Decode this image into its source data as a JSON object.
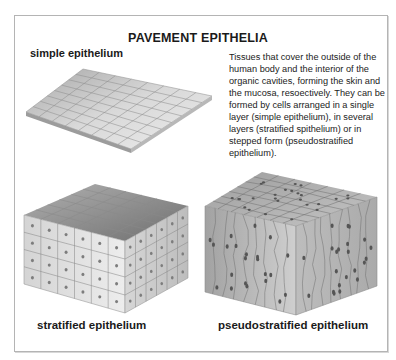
{
  "title": "PAVEMENT EPITHELIA",
  "figures": {
    "simple": {
      "label": "simple epithelium",
      "rows": 8,
      "cols": 8
    },
    "stratified": {
      "label": "stratified epithelium",
      "layers": 4,
      "grid": 6
    },
    "pseudostratified": {
      "label": "pseudostratified epithelium"
    }
  },
  "description": {
    "lines": [
      "Tissues that cover the outside of the",
      "human body and the interior of the",
      "organic cavities, forming the skin and",
      "the mucosa, resoectively. They can be",
      "formed by cells arranged in a single",
      "layer (simple epithelium), in several",
      "layers (stratified spithelium) or in",
      "stepped form (pseudostratified",
      "epithelium)."
    ]
  },
  "colors": {
    "frame_border": "#b4b4b4",
    "text": "#1a1a1a",
    "cell_light": "#e6e6e6",
    "cell_dark": "#8c8c8c",
    "nucleus": "#6a6a6a"
  }
}
